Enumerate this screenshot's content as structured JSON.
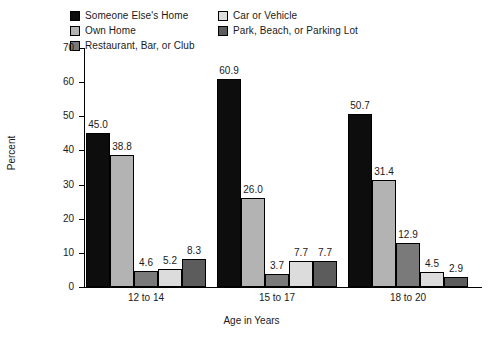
{
  "chart_data": {
    "type": "bar",
    "title": "",
    "subtitle": "",
    "xlabel": "Age in Years",
    "ylabel": "Percent",
    "categories": [
      "12 to 14",
      "15 to 17",
      "18 to 20"
    ],
    "ylim": [
      0,
      70
    ],
    "yticks": [
      0,
      10,
      20,
      30,
      40,
      50,
      60,
      70
    ],
    "ytick_labels": [
      "0",
      "10",
      "20",
      "30",
      "40",
      "50",
      "60",
      "70"
    ],
    "grid": false,
    "legend_position": "top",
    "series": [
      {
        "name": "Someone Else's Home",
        "color": "#0d0d0d",
        "values": [
          45.0,
          60.9,
          50.7
        ],
        "labels": [
          "45.0",
          "60.9",
          "50.7"
        ]
      },
      {
        "name": "Own Home",
        "color": "#b3b3b3",
        "values": [
          38.8,
          26.0,
          31.4
        ],
        "labels": [
          "38.8",
          "26.0",
          "31.4"
        ]
      },
      {
        "name": "Restaurant, Bar, or Club",
        "color": "#7a7a7a",
        "values": [
          4.6,
          3.7,
          12.9
        ],
        "labels": [
          "4.6",
          "3.7",
          "12.9"
        ]
      },
      {
        "name": "Car or Vehicle",
        "color": "#dcdcdc",
        "values": [
          5.2,
          7.7,
          4.5
        ],
        "labels": [
          "5.2",
          "7.7",
          "4.5"
        ]
      },
      {
        "name": "Park, Beach, or Parking Lot",
        "color": "#5c5c5c",
        "values": [
          8.3,
          7.7,
          2.9
        ],
        "labels": [
          "8.3",
          "7.7",
          "2.9"
        ]
      }
    ]
  },
  "legend": {
    "entries": [
      {
        "label": "Someone Else's Home",
        "color": "#0d0d0d"
      },
      {
        "label": "Own Home",
        "color": "#b3b3b3"
      },
      {
        "label": "Restaurant, Bar, or Club",
        "color": "#7a7a7a"
      },
      {
        "label": "Car or Vehicle",
        "color": "#dcdcdc"
      },
      {
        "label": "Park, Beach, or Parking Lot",
        "color": "#5c5c5c"
      }
    ]
  }
}
